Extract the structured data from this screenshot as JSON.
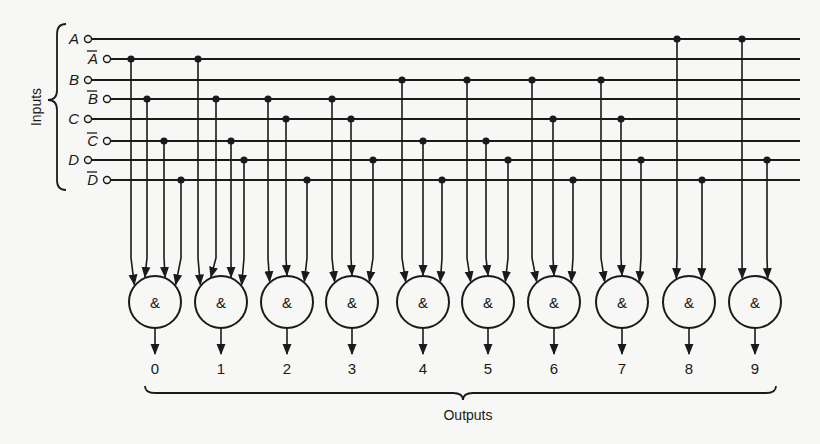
{
  "diagram": {
    "type": "combinational-logic-decoder",
    "colors": {
      "ink": "#1a1a1a",
      "background": "#f7f7f5"
    },
    "inputs_group_label": "Inputs",
    "outputs_group_label": "Outputs",
    "inputs": [
      {
        "id": "A",
        "label": "A",
        "complement": false,
        "y": 39
      },
      {
        "id": "Abar",
        "label": "A",
        "complement": true,
        "y": 59
      },
      {
        "id": "B",
        "label": "B",
        "complement": false,
        "y": 80
      },
      {
        "id": "Bbar",
        "label": "B",
        "complement": true,
        "y": 99
      },
      {
        "id": "C",
        "label": "C",
        "complement": false,
        "y": 119
      },
      {
        "id": "Cbar",
        "label": "C",
        "complement": true,
        "y": 141
      },
      {
        "id": "D",
        "label": "D",
        "complement": false,
        "y": 160
      },
      {
        "id": "Dbar",
        "label": "D",
        "complement": true,
        "y": 180
      }
    ],
    "gate_symbol": "&",
    "gates": [
      {
        "output": "0",
        "cx": 155,
        "taps": [
          {
            "line": "Abar",
            "x": 131
          },
          {
            "line": "Bbar",
            "x": 147
          },
          {
            "line": "Cbar",
            "x": 164
          },
          {
            "line": "Dbar",
            "x": 181
          }
        ]
      },
      {
        "output": "1",
        "cx": 221,
        "taps": [
          {
            "line": "Abar",
            "x": 198
          },
          {
            "line": "Bbar",
            "x": 216
          },
          {
            "line": "Cbar",
            "x": 231
          },
          {
            "line": "D",
            "x": 244
          }
        ]
      },
      {
        "output": "2",
        "cx": 287,
        "taps": [
          {
            "line": "Bbar",
            "x": 268
          },
          {
            "line": "C",
            "x": 286
          },
          {
            "line": "Dbar",
            "x": 307
          }
        ]
      },
      {
        "output": "3",
        "cx": 352,
        "taps": [
          {
            "line": "Bbar",
            "x": 332
          },
          {
            "line": "C",
            "x": 351
          },
          {
            "line": "D",
            "x": 373
          }
        ]
      },
      {
        "output": "4",
        "cx": 423,
        "taps": [
          {
            "line": "B",
            "x": 402
          },
          {
            "line": "Cbar",
            "x": 423
          },
          {
            "line": "Dbar",
            "x": 442
          }
        ]
      },
      {
        "output": "5",
        "cx": 488,
        "taps": [
          {
            "line": "B",
            "x": 467
          },
          {
            "line": "Cbar",
            "x": 486
          },
          {
            "line": "D",
            "x": 508
          }
        ]
      },
      {
        "output": "6",
        "cx": 554,
        "taps": [
          {
            "line": "B",
            "x": 532
          },
          {
            "line": "C",
            "x": 553
          },
          {
            "line": "Dbar",
            "x": 573
          }
        ]
      },
      {
        "output": "7",
        "cx": 622,
        "taps": [
          {
            "line": "B",
            "x": 601
          },
          {
            "line": "C",
            "x": 621
          },
          {
            "line": "D",
            "x": 641
          }
        ]
      },
      {
        "output": "8",
        "cx": 689,
        "taps": [
          {
            "line": "A",
            "x": 677
          },
          {
            "line": "Dbar",
            "x": 702
          }
        ]
      },
      {
        "output": "9",
        "cx": 755,
        "taps": [
          {
            "line": "A",
            "x": 742
          },
          {
            "line": "D",
            "x": 767
          }
        ]
      }
    ]
  }
}
